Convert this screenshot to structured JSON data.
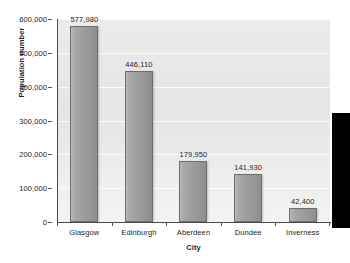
{
  "chart_data": {
    "type": "bar",
    "title": "",
    "xlabel": "City",
    "ylabel": "Population number",
    "categories": [
      "Glasgow",
      "Edinburgh",
      "Aberdeen",
      "Dundee",
      "Inverness"
    ],
    "values": [
      577980,
      446110,
      179950,
      141930,
      42400
    ],
    "value_labels": [
      "577,980",
      "446,110",
      "179,950",
      "141,930",
      "42,400"
    ],
    "ylim": [
      0,
      600000
    ],
    "ytick_values": [
      0,
      100000,
      200000,
      300000,
      400000,
      500000,
      600000
    ],
    "ytick_labels": [
      "0",
      "100,000",
      "200,000",
      "300,000",
      "400,000",
      "500,000",
      "600,000"
    ],
    "grid": true,
    "legend": "none",
    "bar_color": "#9d9d9d",
    "bar_border_color": "#6e6e6e",
    "plot_background": "#eceaea"
  },
  "overlay": {
    "edge_block_color": "#000000"
  }
}
